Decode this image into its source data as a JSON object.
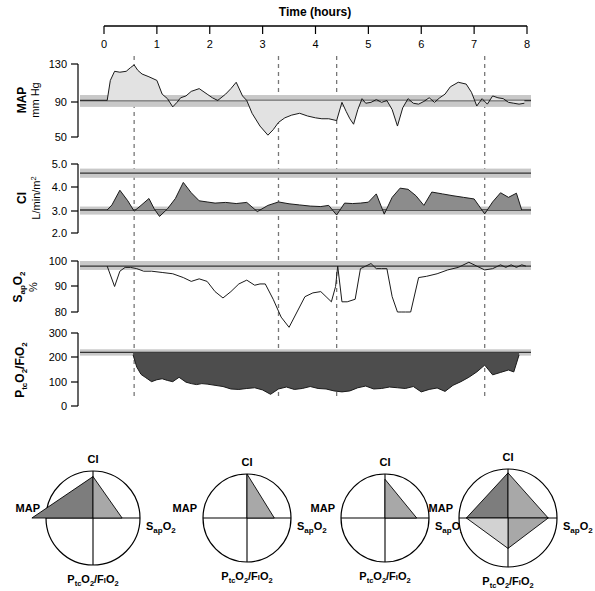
{
  "figure": {
    "time_axis": {
      "title": "Time (hours)",
      "ticks": [
        0,
        1,
        2,
        3,
        4,
        5,
        6,
        7,
        8
      ],
      "tick_labels": [
        "0",
        "1",
        "2",
        "3",
        "4",
        "5",
        "6",
        "7",
        "8"
      ],
      "min": 0,
      "max": 8,
      "unit": "hours"
    },
    "event_markers_hours": [
      0.57,
      3.3,
      4.4,
      7.2
    ],
    "colors": {
      "band_light": "#c8c8c8",
      "band_mid": "#b4b4b4",
      "trace_line": "#1a1a1a",
      "fill_map": "#e2e2e2",
      "fill_ci": "#8c8c8c",
      "fill_ptco2": "#4d4d4d",
      "polar_dark": "#7d7d7d",
      "polar_mid": "#a8a8a8",
      "polar_light": "#d2d2d2",
      "background": "#ffffff"
    }
  },
  "panels": [
    {
      "id": "map",
      "title": "MAP",
      "units": "mm Hg",
      "y_ticks": [
        130,
        90,
        50
      ],
      "y_tick_labels": [
        "130",
        "90",
        "50"
      ],
      "ylim": [
        50,
        130
      ],
      "reference_line": 90,
      "normal_band": [
        83,
        96
      ],
      "fill_style": "light"
    },
    {
      "id": "ci",
      "title": "CI",
      "units": "L/min/m2",
      "units_display": "L/min/m",
      "units_sup": "2",
      "y_ticks": [
        5.0,
        4.0,
        3.0,
        2.0
      ],
      "y_tick_labels": [
        "5.0",
        "4.0",
        "3.0",
        "2.0"
      ],
      "ylim": [
        2.0,
        5.0
      ],
      "reference_lines": [
        4.6,
        3.0
      ],
      "normal_bands": [
        [
          4.4,
          4.8
        ],
        [
          2.8,
          3.15
        ]
      ],
      "fill_style": "mid"
    },
    {
      "id": "sapo2",
      "title": "SapO2",
      "title_main": "S",
      "title_sub": "ap",
      "title_tail": "O",
      "title_tail_sub": "2",
      "units": "%",
      "y_ticks": [
        100,
        90,
        80
      ],
      "y_tick_labels": [
        "100",
        "90",
        "80"
      ],
      "ylim": [
        72,
        102
      ],
      "reference_line": 98,
      "normal_band": [
        96.5,
        100
      ],
      "fill_style": "none"
    },
    {
      "id": "ptco2fio2",
      "title": "PtcO2/FIO2",
      "units": "",
      "y_ticks": [
        300,
        200,
        100,
        0
      ],
      "y_tick_labels": [
        "300",
        "200",
        "100",
        "0"
      ],
      "ylim": [
        0,
        300
      ],
      "reference_line": 220,
      "normal_band": [
        207,
        233
      ],
      "fill_style": "dark"
    }
  ],
  "chart_data": [
    {
      "type": "area",
      "id": "map",
      "title": "MAP",
      "ylabel": "MAP mm Hg",
      "xlabel": "Time (hours)",
      "ylim": [
        50,
        130
      ],
      "xlim": [
        0,
        8
      ],
      "baseline": 90,
      "x": [
        0.06,
        0.12,
        0.2,
        0.3,
        0.42,
        0.5,
        0.57,
        0.64,
        0.72,
        0.85,
        1.0,
        1.1,
        1.2,
        1.3,
        1.38,
        1.45,
        1.55,
        1.65,
        1.8,
        1.95,
        2.05,
        2.15,
        2.3,
        2.4,
        2.5,
        2.62,
        2.7,
        2.8,
        2.95,
        3.1,
        3.2,
        3.3,
        3.42,
        3.55,
        3.7,
        3.85,
        4.0,
        4.12,
        4.25,
        4.4,
        4.5,
        4.58,
        4.65,
        4.72,
        4.8,
        4.88,
        4.95,
        5.05,
        5.15,
        5.25,
        5.35,
        5.45,
        5.55,
        5.65,
        5.75,
        5.85,
        5.95,
        6.05,
        6.15,
        6.25,
        6.35,
        6.45,
        6.55,
        6.7,
        6.85,
        6.95,
        7.05,
        7.15,
        7.25,
        7.35,
        7.45,
        7.55,
        7.65,
        7.75,
        7.85,
        7.95
      ],
      "y": [
        90,
        112,
        122,
        121,
        122,
        126,
        129,
        123,
        119,
        116,
        112,
        97,
        92,
        83,
        88,
        93,
        95,
        100,
        103,
        97,
        93,
        90,
        97,
        103,
        110,
        95,
        90,
        76,
        62,
        52,
        58,
        66,
        71,
        74,
        76,
        73,
        71,
        70,
        70,
        68,
        88,
        78,
        70,
        64,
        80,
        92,
        87,
        88,
        91,
        88,
        90,
        80,
        62,
        82,
        92,
        87,
        86,
        89,
        93,
        88,
        93,
        97,
        105,
        110,
        108,
        99,
        84,
        92,
        86,
        95,
        93,
        92,
        88,
        87,
        86,
        87
      ]
    },
    {
      "type": "area",
      "id": "ci",
      "title": "CI",
      "ylabel": "CI L/min/m2",
      "xlabel": "Time (hours)",
      "ylim": [
        2.0,
        5.0
      ],
      "xlim": [
        0,
        8
      ],
      "baseline": 3.0,
      "x": [
        0.06,
        0.15,
        0.3,
        0.45,
        0.57,
        0.7,
        0.85,
        0.95,
        1.05,
        1.2,
        1.35,
        1.5,
        1.65,
        1.8,
        1.95,
        2.1,
        2.3,
        2.5,
        2.7,
        2.9,
        3.1,
        3.3,
        3.5,
        3.7,
        3.9,
        4.1,
        4.25,
        4.4,
        4.55,
        4.7,
        4.85,
        5.0,
        5.15,
        5.3,
        5.45,
        5.6,
        5.75,
        5.9,
        6.05,
        6.2,
        6.4,
        6.6,
        6.8,
        7.0,
        7.2,
        7.35,
        7.5,
        7.65,
        7.8,
        7.9
      ],
      "y": [
        3.0,
        3.22,
        3.86,
        3.4,
        2.95,
        3.2,
        3.5,
        3.05,
        2.72,
        3.05,
        3.5,
        4.2,
        3.75,
        3.4,
        3.35,
        3.3,
        3.33,
        3.28,
        3.33,
        2.93,
        3.2,
        3.35,
        3.27,
        3.22,
        3.17,
        3.15,
        3.2,
        2.78,
        3.3,
        3.28,
        3.3,
        3.34,
        3.7,
        2.82,
        3.55,
        3.95,
        3.9,
        3.62,
        3.2,
        3.78,
        3.7,
        3.62,
        3.55,
        3.48,
        2.83,
        3.35,
        3.75,
        3.55,
        3.73,
        3.0
      ]
    },
    {
      "type": "line",
      "id": "sapo2",
      "title": "SapO2",
      "ylabel": "SapO2 %",
      "xlabel": "Time (hours)",
      "ylim": [
        72,
        102
      ],
      "xlim": [
        0,
        8
      ],
      "x": [
        0.06,
        0.2,
        0.3,
        0.4,
        0.5,
        0.62,
        0.75,
        0.9,
        1.1,
        1.3,
        1.5,
        1.65,
        1.8,
        1.95,
        2.1,
        2.25,
        2.4,
        2.55,
        2.7,
        2.85,
        2.95,
        3.05,
        3.2,
        3.35,
        3.5,
        3.65,
        3.8,
        3.95,
        4.1,
        4.2,
        4.3,
        4.38,
        4.42,
        4.5,
        4.6,
        4.75,
        4.85,
        4.95,
        5.05,
        5.15,
        5.25,
        5.35,
        5.45,
        5.55,
        5.62,
        5.7,
        5.8,
        5.95,
        6.1,
        6.3,
        6.5,
        6.7,
        6.9,
        7.05,
        7.2,
        7.35,
        7.5,
        7.6,
        7.7,
        7.8,
        7.9,
        7.98
      ],
      "y": [
        98,
        90,
        96,
        97.5,
        97.5,
        97,
        96,
        96,
        95.5,
        95,
        93.5,
        92,
        93,
        92,
        88,
        85.5,
        88,
        91,
        92.5,
        90.5,
        91,
        91,
        85,
        78,
        74,
        80,
        86,
        87.5,
        88,
        86,
        84,
        90,
        98,
        84,
        84,
        85,
        97,
        98,
        99,
        97,
        97,
        97,
        86,
        80,
        80,
        80,
        80,
        93.5,
        94,
        95,
        96.5,
        97.5,
        99.5,
        98,
        96.5,
        97,
        98.5,
        97.5,
        98.5,
        97.5,
        98.5,
        98
      ]
    },
    {
      "type": "area",
      "id": "ptco2fio2",
      "title": "PtcO2/FIO2",
      "ylabel": "PtcO2/FIO2",
      "xlabel": "Time (hours)",
      "ylim": [
        0,
        300
      ],
      "xlim": [
        0,
        8
      ],
      "baseline": 220,
      "x": [
        0.55,
        0.62,
        0.7,
        0.78,
        0.9,
        1.0,
        1.1,
        1.2,
        1.3,
        1.42,
        1.55,
        1.65,
        1.75,
        1.85,
        1.95,
        2.1,
        2.25,
        2.4,
        2.55,
        2.7,
        2.85,
        3.0,
        3.15,
        3.3,
        3.45,
        3.6,
        3.75,
        3.9,
        4.05,
        4.2,
        4.35,
        4.5,
        4.65,
        4.8,
        4.95,
        5.1,
        5.25,
        5.4,
        5.55,
        5.7,
        5.85,
        6.0,
        6.15,
        6.3,
        6.45,
        6.6,
        6.75,
        6.9,
        7.05,
        7.2,
        7.35,
        7.5,
        7.65,
        7.75,
        7.85
      ],
      "y": [
        210,
        160,
        130,
        118,
        100,
        108,
        112,
        105,
        100,
        118,
        98,
        92,
        88,
        92,
        90,
        85,
        80,
        70,
        68,
        72,
        75,
        66,
        48,
        70,
        78,
        68,
        72,
        80,
        72,
        70,
        62,
        58,
        62,
        75,
        82,
        70,
        72,
        78,
        75,
        72,
        80,
        58,
        68,
        74,
        60,
        85,
        100,
        118,
        140,
        168,
        128,
        138,
        148,
        140,
        210
      ]
    },
    {
      "type": "pie",
      "id": "polar-charts",
      "title": "Physiologic profile polar plots",
      "axes": [
        "CI",
        "MAP",
        "PtcO2/FIO2",
        "SapO2"
      ],
      "charts": [
        {
          "index": 1,
          "values": {
            "CI": 0.88,
            "MAP": 1.3,
            "PtcO2/FIO2": 0.0,
            "SapO2": 0.62
          }
        },
        {
          "index": 2,
          "values": {
            "CI": 1.0,
            "MAP": 0.0,
            "PtcO2/FIO2": 0.0,
            "SapO2": 0.62
          }
        },
        {
          "index": 3,
          "values": {
            "CI": 0.88,
            "MAP": 0.0,
            "PtcO2/FIO2": 0.0,
            "SapO2": 0.72
          }
        },
        {
          "index": 4,
          "values": {
            "CI": 0.92,
            "MAP": 0.85,
            "PtcO2/FIO2": 0.62,
            "SapO2": 0.82
          }
        }
      ]
    }
  ],
  "polar_charts": [
    {
      "id": "polar-1",
      "labels": {
        "top": "CI",
        "left": "MAP",
        "right": "SapO2",
        "bottom": "PtcO2/FIO2"
      }
    },
    {
      "id": "polar-2",
      "labels": {
        "top": "CI",
        "left": "MAP",
        "right": "SapO2",
        "bottom": "PtcO2/FIO2"
      }
    },
    {
      "id": "polar-3",
      "labels": {
        "top": "CI",
        "left": "MAP",
        "right": "SapO2",
        "bottom": "PtcO2/FIO2"
      }
    },
    {
      "id": "polar-4",
      "labels": {
        "top": "CI",
        "left": "MAP",
        "right": "SapO2",
        "bottom": "PtcO2/FIO2"
      }
    }
  ],
  "labels": {
    "time_title": "Time (hours)",
    "map_title": "MAP",
    "map_units": "mm Hg",
    "ci_title": "CI",
    "ci_units": "L/min/m",
    "ci_units_sup": "2",
    "sapo2_s": "S",
    "sapo2_ap": "ap",
    "sapo2_o": "O",
    "sapo2_2": "2",
    "sapo2_units": "%",
    "ptco2_p": "P",
    "ptco2_tc": "tc",
    "ptco2_o": "O",
    "ptco2_2": "2",
    "ptco2_slash": "/F",
    "ptco2_i": "I",
    "ptco2_o2": "O",
    "ptco2_22": "2",
    "polar_ci": "CI",
    "polar_map": "MAP",
    "polar_sapo2_s": "S",
    "polar_sapo2_ap": "ap",
    "polar_sapo2_o": "O",
    "polar_sapo2_2": "2",
    "polar_ptco2": "PtcO2/FIO2"
  }
}
